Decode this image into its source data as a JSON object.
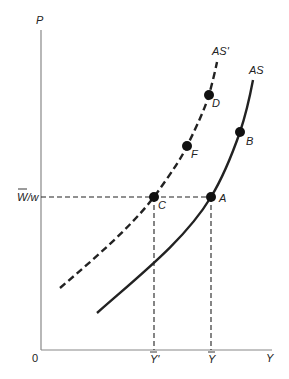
{
  "diagram": {
    "axes": {
      "y_label": "P",
      "x_label": "Y",
      "origin_label": "0"
    },
    "ticks": {
      "x": [
        {
          "label": "Y'",
          "overbar": true,
          "x": 154
        },
        {
          "label": "Y",
          "overbar": true,
          "x": 211
        }
      ],
      "y": [
        {
          "label": "W/w",
          "overbar_on_W": true,
          "y": 197
        }
      ]
    },
    "curves": [
      {
        "name": "AS'",
        "style": "dashed",
        "label": "AS'"
      },
      {
        "name": "AS",
        "style": "solid",
        "label": "AS"
      }
    ],
    "points": [
      {
        "label": "A",
        "curve": "AS"
      },
      {
        "label": "B",
        "curve": "AS"
      },
      {
        "label": "C",
        "curve": "AS'"
      },
      {
        "label": "D",
        "curve": "AS'"
      },
      {
        "label": "F",
        "curve": "AS'"
      }
    ],
    "colors": {
      "axis": "#888888",
      "curve": "#222222",
      "point": "#111111"
    }
  }
}
